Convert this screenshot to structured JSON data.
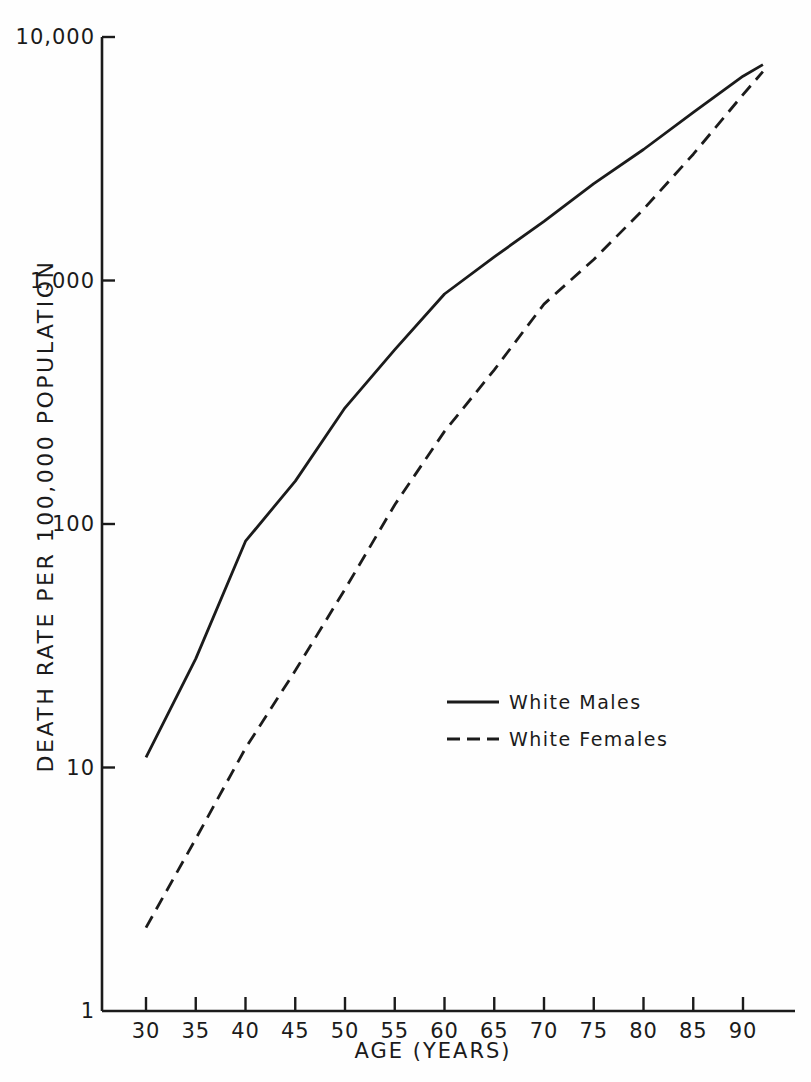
{
  "figure": {
    "background": "#fefefe",
    "ink_color": "#1b1b1b"
  },
  "chart_data": {
    "type": "line",
    "title": "",
    "xlabel": "AGE (YEARS)",
    "ylabel": "DEATH RATE PER 100,000 POPULATION",
    "y_scale": "log",
    "ylim": [
      1,
      10000
    ],
    "xlim": [
      25.8,
      95
    ],
    "grid": false,
    "x_ticks": [
      30,
      35,
      40,
      45,
      50,
      55,
      60,
      65,
      70,
      75,
      80,
      85,
      90
    ],
    "x_tick_labels": [
      "30",
      "35",
      "40",
      "45",
      "50",
      "55",
      "60",
      "65",
      "70",
      "75",
      "80",
      "85",
      "90"
    ],
    "y_ticks": [
      1,
      10,
      100,
      1000,
      10000
    ],
    "y_tick_labels": [
      "1",
      "10",
      "100",
      "1,000",
      "10,000"
    ],
    "legend_position": "center-right",
    "x": [
      30,
      35,
      40,
      45,
      50,
      55,
      60,
      65,
      70,
      75,
      80,
      85,
      90,
      92
    ],
    "series": [
      {
        "name": "White Males",
        "line_style": "solid",
        "values": [
          11,
          28,
          85,
          150,
          300,
          520,
          880,
          1250,
          1750,
          2500,
          3450,
          4900,
          6900,
          7700
        ]
      },
      {
        "name": "White Females",
        "line_style": "dashed",
        "values": [
          2.2,
          5.1,
          12,
          25,
          54,
          120,
          240,
          430,
          800,
          1220,
          1960,
          3300,
          5800,
          7200
        ]
      }
    ]
  }
}
